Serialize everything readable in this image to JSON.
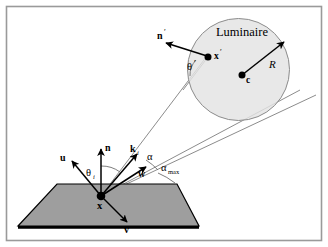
{
  "figure": {
    "title_text": "Luminaire",
    "colors": {
      "frame_border": "#9a9a9a",
      "background": "#ffffff",
      "plane_fill": "#9e9e9e",
      "plane_stroke": "#000000",
      "plane_shadow": "#000000",
      "sphere_fill": "#e3e3e3",
      "sphere_stroke": "#8c8c8c",
      "vector_stroke": "#000000",
      "ray_stroke": "#8c8c8c",
      "point_fill": "#000000",
      "label_color": "#000000"
    },
    "frame": {
      "x": 6,
      "y": 6,
      "width": 316,
      "height": 235
    },
    "plane": {
      "name": "surface-plane",
      "points": "18,226 57,184 177,184 199,226"
    },
    "sphere": {
      "name": "luminaire-sphere",
      "cx": 238.5,
      "cy": 69.5,
      "r": 51
    },
    "points": [
      {
        "id": "x",
        "label": "x",
        "cx": 101,
        "cy": 196,
        "r": 4.2,
        "lx": 96,
        "ly": 208,
        "italic": false,
        "bold": true,
        "prime": false
      },
      {
        "id": "xprime",
        "label": "x",
        "cx": 209,
        "cy": 58,
        "r": 3.4,
        "lx": 215,
        "ly": 58,
        "italic": false,
        "bold": true,
        "prime": true
      },
      {
        "id": "c",
        "label": "c",
        "cx": 242,
        "cy": 75,
        "r": 3.4,
        "lx": 247,
        "ly": 81,
        "italic": false,
        "bold": true,
        "prime": false
      }
    ],
    "vectors": [
      {
        "id": "u",
        "label": "u",
        "x1": 101,
        "y1": 196,
        "x2": 71,
        "y2": 160,
        "lx": 62,
        "ly": 160,
        "bold": true,
        "prime": false
      },
      {
        "id": "n",
        "label": "n",
        "x1": 101,
        "y1": 196,
        "x2": 101,
        "y2": 148,
        "lx": 105,
        "ly": 150,
        "bold": true,
        "prime": false
      },
      {
        "id": "ki",
        "label": "k",
        "sub": "i",
        "x1": 101,
        "y1": 196,
        "x2": 138,
        "y2": 153,
        "lx": 133,
        "ly": 152,
        "bold": true,
        "prime": false
      },
      {
        "id": "w",
        "label": "w",
        "x1": 101,
        "y1": 196,
        "x2": 145,
        "y2": 166,
        "lx": 140,
        "ly": 176,
        "bold": true,
        "prime": false
      },
      {
        "id": "v",
        "label": "v",
        "x1": 101,
        "y1": 196,
        "x2": 127,
        "y2": 221,
        "lx": 126,
        "ly": 232,
        "bold": true,
        "prime": false
      },
      {
        "id": "nprime",
        "label": "n",
        "x1": 206,
        "y1": 57,
        "x2": 166,
        "y2": 42,
        "lx": 160,
        "ly": 38,
        "bold": true,
        "prime": true
      },
      {
        "id": "R",
        "label": "R",
        "x1": 242,
        "y1": 75,
        "x2": 285,
        "y2": 43,
        "lx": 272,
        "ly": 65,
        "italic": true,
        "bold": false,
        "prime": false
      }
    ],
    "rays": [
      {
        "id": "ray-to-xprime",
        "x1": 101,
        "y1": 196,
        "x2": 206,
        "y2": 57
      },
      {
        "id": "ray-to-center",
        "x1": 101,
        "y1": 196,
        "x2": 288,
        "y2": 97
      },
      {
        "id": "tangent-upper",
        "x1": 101,
        "y1": 196,
        "x2": 318,
        "y2": 94
      },
      {
        "id": "theta-prime-ray",
        "x1": 185,
        "y1": 86,
        "x2": 206,
        "y2": 57
      }
    ],
    "angles": [
      {
        "id": "alpha",
        "label": "α",
        "lx": 151,
        "ly": 159,
        "sub": null
      },
      {
        "id": "alpha-max",
        "label": "α",
        "lx": 163,
        "ly": 170,
        "sub": "max"
      },
      {
        "id": "theta-i",
        "label": "θ",
        "lx": 88,
        "ly": 173,
        "sub": "i"
      },
      {
        "id": "theta-prime",
        "label": "θ",
        "lx": 190,
        "ly": 68,
        "sub": null,
        "prime": true
      }
    ],
    "arcs": [
      {
        "id": "arc-alpha",
        "d": "M 145,160 A 62,62 0 0 1 157,169"
      },
      {
        "id": "arc-alpha-max",
        "d": "M 157,172 A 72,72 0 0 1 172,181"
      },
      {
        "id": "arc-theta-i",
        "d": "M 101,163 A 33,33 0 0 1 118,169"
      },
      {
        "id": "arc-theta-prime",
        "d": "M 190,73 A 22,22 0 0 1 197,61"
      }
    ]
  }
}
